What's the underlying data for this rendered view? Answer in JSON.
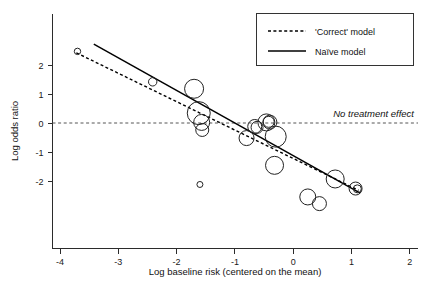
{
  "chart_data": {
    "type": "scatter",
    "title": "",
    "subtitle": "",
    "xlabel": "Log baseline risk (centered on the mean)",
    "ylabel": "Log odds ratio",
    "xlim": [
      -4.2,
      2.0
    ],
    "ylim": [
      -3.05,
      2.75
    ],
    "xticks": [
      -4,
      -3,
      -2,
      -1,
      0,
      1,
      2
    ],
    "xtick_labels": [
      "-4",
      "-3",
      "-2",
      "-1",
      "0",
      "1",
      "2"
    ],
    "yticks": [
      2,
      1,
      0,
      -1,
      -2
    ],
    "ytick_labels": [
      "2",
      "1",
      "0",
      "-1",
      "-2"
    ],
    "grid": false,
    "legend_position": "top-right",
    "bubble_note": "marker size proportional to study weight (inverse variance)",
    "points": [
      {
        "x": -3.7,
        "y": 2.47,
        "size": 3.2
      },
      {
        "x": -2.41,
        "y": 1.42,
        "size": 4.2
      },
      {
        "x": -1.7,
        "y": 1.18,
        "size": 9.5
      },
      {
        "x": -1.62,
        "y": 0.34,
        "size": 11.5
      },
      {
        "x": -1.57,
        "y": 0.02,
        "size": 8.0
      },
      {
        "x": -1.56,
        "y": -0.24,
        "size": 6.5
      },
      {
        "x": -1.6,
        "y": -2.12,
        "size": 3.0
      },
      {
        "x": -0.8,
        "y": -0.52,
        "size": 7.5
      },
      {
        "x": -0.66,
        "y": -0.12,
        "size": 7.0
      },
      {
        "x": -0.62,
        "y": -0.15,
        "size": 6.0
      },
      {
        "x": -0.46,
        "y": 0.02,
        "size": 8.5
      },
      {
        "x": -0.4,
        "y": 0.03,
        "size": 7.0
      },
      {
        "x": -0.42,
        "y": 0.04,
        "size": 5.5
      },
      {
        "x": -0.3,
        "y": -0.47,
        "size": 10.5
      },
      {
        "x": -0.32,
        "y": -1.46,
        "size": 9.0
      },
      {
        "x": 0.25,
        "y": -2.55,
        "size": 8.0
      },
      {
        "x": 0.45,
        "y": -2.78,
        "size": 7.0
      },
      {
        "x": 0.72,
        "y": -1.93,
        "size": 9.0
      },
      {
        "x": 1.07,
        "y": -2.26,
        "size": 6.5
      },
      {
        "x": 1.1,
        "y": -2.27,
        "size": 4.0
      }
    ],
    "series": [
      {
        "name": "'Correct' model",
        "style": "dashed",
        "type": "line",
        "x": [
          -3.72,
          1.12
        ],
        "y": [
          2.42,
          -2.32
        ]
      },
      {
        "name": "Naïve model",
        "style": "solid",
        "type": "line",
        "x": [
          -3.42,
          1.15
        ],
        "y": [
          2.72,
          -2.42
        ]
      }
    ],
    "reference_lines": [
      {
        "label": "No treatment effect",
        "orientation": "horizontal",
        "value": 0,
        "style": "dashed"
      }
    ]
  },
  "legend": {
    "entries": [
      {
        "label": "'Correct' model",
        "style": "dashed"
      },
      {
        "label": "Naïve model",
        "style": "solid"
      }
    ]
  },
  "annotations": {
    "no_treatment_effect": "No treatment effect"
  },
  "axes": {
    "x_title": "Log baseline risk (centered on the mean)",
    "y_title": "Log odds ratio"
  }
}
